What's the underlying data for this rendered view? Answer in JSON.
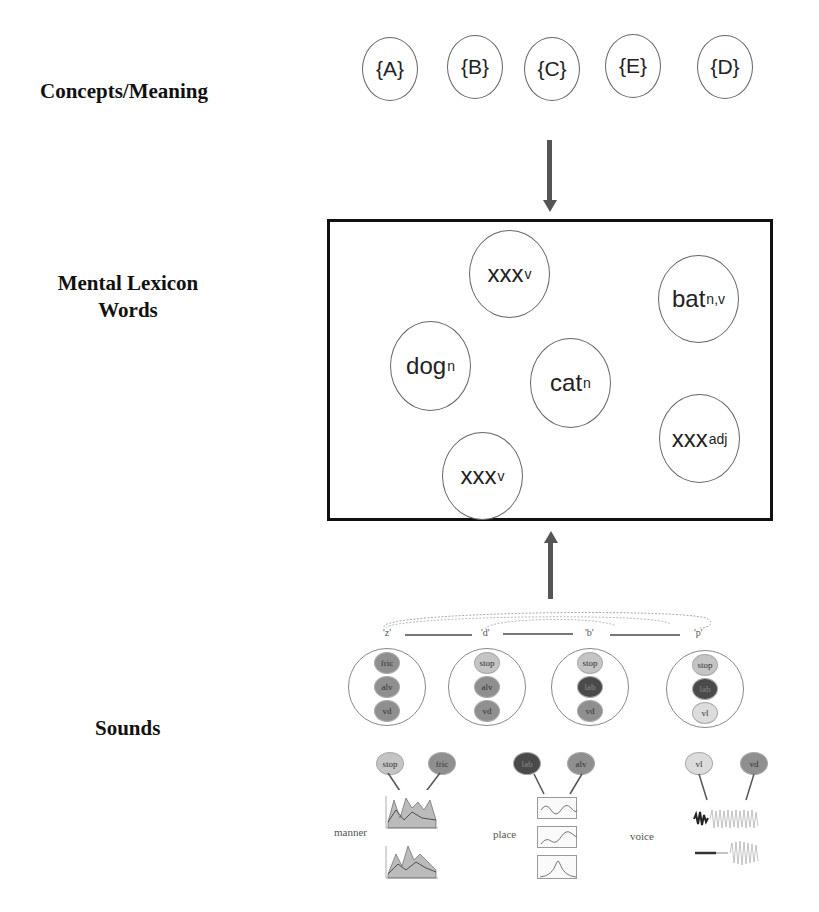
{
  "levels": {
    "concepts": "Concepts/Meaning",
    "lexicon_line1": "Mental Lexicon",
    "lexicon_line2": "Words",
    "sounds": "Sounds"
  },
  "concepts": [
    "{A}",
    "{B}",
    "{C}",
    "{E}",
    "{D}"
  ],
  "words": [
    {
      "base": "xxx",
      "sub": "v"
    },
    {
      "base": "bat ",
      "sub": "n,v"
    },
    {
      "base": "dog",
      "sub": "n"
    },
    {
      "base": "cat",
      "sub": "n"
    },
    {
      "base": "xxx",
      "sub": "adj"
    },
    {
      "base": "xxx",
      "sub": "v"
    }
  ],
  "phonemes": [
    "'z'",
    "'d'",
    "'b'",
    "'p'"
  ],
  "segments": [
    {
      "features": [
        "fric",
        "alv",
        "vd"
      ],
      "colors": [
        "#8f8f8f",
        "#8f8f8f",
        "#8f8f8f"
      ]
    },
    {
      "features": [
        "stop",
        "alv",
        "vd"
      ],
      "colors": [
        "#c4c4c4",
        "#8f8f8f",
        "#8f8f8f"
      ]
    },
    {
      "features": [
        "stop",
        "lab",
        "vd"
      ],
      "colors": [
        "#c4c4c4",
        "#4a4a4a",
        "#8f8f8f"
      ]
    },
    {
      "features": [
        "stop",
        "lab",
        "vl"
      ],
      "colors": [
        "#c4c4c4",
        "#4a4a4a",
        "#dcdcdc"
      ]
    }
  ],
  "dimensions": [
    {
      "label": "manner",
      "values": [
        "stop",
        "fric"
      ],
      "colors": [
        "#c4c4c4",
        "#8f8f8f"
      ]
    },
    {
      "label": "place",
      "values": [
        "lab",
        "alv"
      ],
      "colors": [
        "#4a4a4a",
        "#8f8f8f"
      ]
    },
    {
      "label": "voice",
      "values": [
        "vl",
        "vd"
      ],
      "colors": [
        "#dcdcdc",
        "#8f8f8f"
      ]
    }
  ]
}
